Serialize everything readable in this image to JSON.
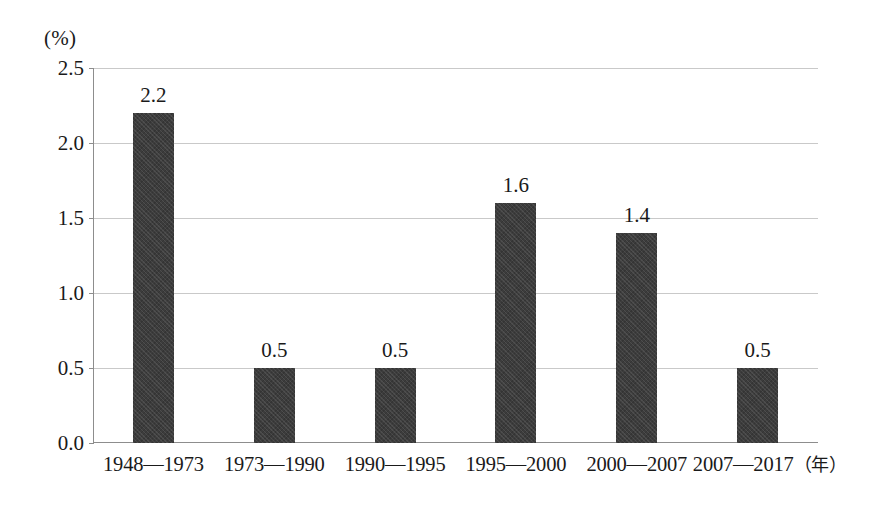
{
  "chart_data": {
    "type": "bar",
    "title": "",
    "subtitle": "",
    "xlabel": "",
    "ylabel": "(%)",
    "unit_label": "(%)",
    "x_unit_suffix": "（年）",
    "categories": [
      "1948—1973",
      "1973—1990",
      "1990—1995",
      "1995—2000",
      "2000—2007",
      "2007—2017"
    ],
    "values": [
      2.2,
      0.5,
      0.5,
      1.6,
      1.4,
      0.5
    ],
    "value_labels": [
      "2.2",
      "0.5",
      "0.5",
      "1.6",
      "1.4",
      "0.5"
    ],
    "ylim": [
      0.0,
      2.5
    ],
    "yticks": [
      2.5,
      2.0,
      1.5,
      1.0,
      0.5,
      0.0
    ],
    "ytick_labels": [
      "2.5",
      "2.0",
      "1.5",
      "1.0",
      "0.5",
      "0.0"
    ],
    "grid": true,
    "legend": false,
    "legend_position": "none",
    "bar_color": "#3c3c3c",
    "gridline_color": "#c9c9c9",
    "axis_color": "#8d8d8d",
    "background_color": "#ffffff"
  }
}
